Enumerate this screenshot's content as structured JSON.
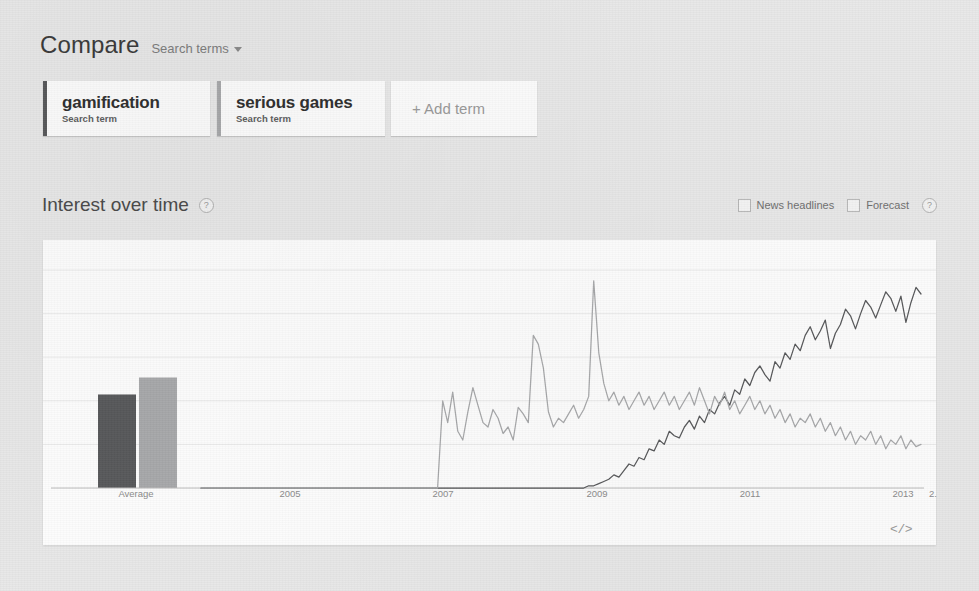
{
  "header": {
    "compare_label": "Compare",
    "filter_label": "Search terms",
    "caret_icon": "chevron-down-icon"
  },
  "terms": {
    "cards": [
      {
        "term": "gamification",
        "subtitle": "Search term",
        "color": "#58595b"
      },
      {
        "term": "serious games",
        "subtitle": "Search term",
        "color": "#a8a9ab"
      }
    ],
    "add_label": "+ Add term"
  },
  "section": {
    "title": "Interest over time",
    "help_icon": "question-mark-icon",
    "help_glyph": "?",
    "options": [
      {
        "label": "News headlines",
        "checked": false
      },
      {
        "label": "Forecast",
        "checked": false
      }
    ],
    "options_help_glyph": "?"
  },
  "panel": {
    "embed_label": "</>",
    "embed_icon": "embed-code-icon"
  },
  "chart_data": {
    "type": "line",
    "title": "Interest over time",
    "xlabel": "",
    "ylabel": "",
    "ylim": [
      0,
      100
    ],
    "grid": true,
    "legend": "none",
    "x_tick_labels": [
      "Average",
      "2005",
      "2007",
      "2009",
      "2011",
      "2013",
      "2."
    ],
    "series": [
      {
        "name": "gamification",
        "color": "#58595b",
        "average": 22,
        "values": [
          0,
          0,
          0,
          0,
          0,
          0,
          0,
          0,
          0,
          0,
          0,
          0,
          0,
          0,
          0,
          0,
          0,
          0,
          0,
          0,
          0,
          0,
          0,
          0,
          0,
          0,
          0,
          0,
          0,
          0,
          0,
          0,
          0,
          0,
          0,
          0,
          0,
          0,
          0,
          0,
          0,
          0,
          0,
          0,
          0,
          0,
          0,
          0,
          0,
          0,
          0,
          0,
          0,
          0,
          0,
          0,
          0,
          0,
          0,
          0,
          0,
          0,
          0,
          0,
          0,
          0,
          0,
          0,
          0,
          0,
          0,
          0,
          0,
          0,
          0,
          0,
          0,
          1,
          1,
          2,
          3,
          4,
          6,
          5,
          8,
          11,
          10,
          14,
          13,
          18,
          17,
          22,
          20,
          26,
          24,
          23,
          28,
          31,
          27,
          33,
          30,
          36,
          34,
          39,
          42,
          38,
          45,
          43,
          50,
          47,
          53,
          56,
          52,
          49,
          58,
          55,
          62,
          59,
          66,
          63,
          70,
          74,
          68,
          72,
          77,
          64,
          71,
          75,
          82,
          79,
          73,
          80,
          86,
          83,
          78,
          84,
          90,
          87,
          81,
          88,
          76,
          85,
          92,
          89
        ]
      },
      {
        "name": "serious games",
        "color": "#a8a9ab",
        "average": 26,
        "values": [
          0,
          0,
          0,
          0,
          0,
          0,
          0,
          0,
          0,
          0,
          0,
          0,
          0,
          0,
          0,
          0,
          0,
          0,
          0,
          0,
          0,
          0,
          0,
          0,
          0,
          0,
          0,
          0,
          0,
          0,
          0,
          0,
          0,
          0,
          0,
          0,
          0,
          0,
          0,
          0,
          0,
          0,
          0,
          0,
          0,
          0,
          0,
          0,
          40,
          30,
          44,
          26,
          22,
          35,
          46,
          38,
          30,
          28,
          36,
          32,
          25,
          28,
          22,
          37,
          34,
          30,
          70,
          66,
          55,
          35,
          28,
          32,
          30,
          34,
          38,
          32,
          36,
          42,
          95,
          62,
          48,
          40,
          44,
          38,
          42,
          36,
          40,
          44,
          38,
          42,
          36,
          40,
          44,
          38,
          42,
          36,
          40,
          44,
          38,
          46,
          40,
          34,
          42,
          38,
          44,
          36,
          40,
          34,
          38,
          42,
          36,
          40,
          34,
          38,
          32,
          36,
          30,
          34,
          28,
          32,
          30,
          34,
          28,
          32,
          26,
          30,
          24,
          28,
          22,
          26,
          20,
          24,
          22,
          26,
          20,
          24,
          18,
          22,
          20,
          24,
          18,
          22,
          19,
          20
        ]
      }
    ],
    "bar_chart": {
      "type": "bar",
      "label": "Average",
      "categories": [
        "gamification",
        "serious games"
      ],
      "values": [
        22,
        26
      ]
    }
  }
}
